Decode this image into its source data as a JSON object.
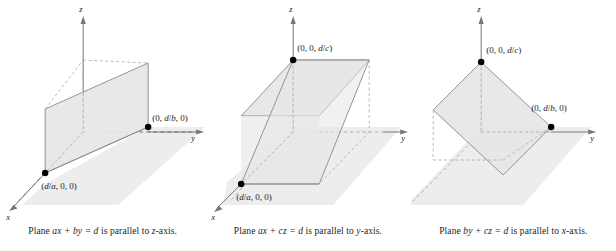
{
  "figure": {
    "background_color": "#ffffff",
    "plane_fill": "#ededed",
    "plane_fill_dark": "#e2e2e2",
    "stroke_color": "#8a8a8a",
    "axis_color": "#777777",
    "dash_color": "#a8a8a8",
    "vertex_color": "#000000",
    "text_color": "#1c1c1c"
  },
  "panels": [
    {
      "id": "panel-1",
      "caption": "Plane ax + by = d is parallel to z-axis.",
      "caption_parts": {
        "lead": "Plane ",
        "equation": "ax + by = d",
        "middle": " is parallel to ",
        "axis": "z",
        "tail": "-axis."
      },
      "axes": [
        {
          "name": "x",
          "label": "x"
        },
        {
          "name": "y",
          "label": "y"
        },
        {
          "name": "z",
          "label": "z"
        }
      ],
      "points": [
        {
          "name": "x-intercept",
          "label": "(d/a, 0, 0)",
          "coords": "d/a, 0, 0"
        },
        {
          "name": "y-intercept",
          "label": "(0, d/b, 0)",
          "coords": "0, d/b, 0"
        }
      ],
      "plane_equation": "ax + by = d",
      "parallel_to": "z-axis"
    },
    {
      "id": "panel-2",
      "caption": "Plane ax + cz = d is parallel to y-axis.",
      "caption_parts": {
        "lead": "Plane ",
        "equation": "ax + cz = d",
        "middle": " is parallel to ",
        "axis": "y",
        "tail": "-axis."
      },
      "axes": [
        {
          "name": "x",
          "label": "x"
        },
        {
          "name": "y",
          "label": "y"
        },
        {
          "name": "z",
          "label": "z"
        }
      ],
      "points": [
        {
          "name": "x-intercept",
          "label": "(d/a, 0, 0)",
          "coords": "d/a, 0, 0"
        },
        {
          "name": "z-intercept",
          "label": "(0, 0, d/c)",
          "coords": "0, 0, d/c"
        }
      ],
      "plane_equation": "ax + cz = d",
      "parallel_to": "y-axis"
    },
    {
      "id": "panel-3",
      "caption": "Plane by + cz = d is parallel to x-axis.",
      "caption_parts": {
        "lead": "Plane ",
        "equation": "by + cz = d",
        "middle": " is parallel to ",
        "axis": "x",
        "tail": "-axis."
      },
      "axes": [
        {
          "name": "y",
          "label": "y"
        },
        {
          "name": "z",
          "label": "z"
        }
      ],
      "points": [
        {
          "name": "z-intercept",
          "label": "(0, 0, d/c)",
          "coords": "0, 0, d/c"
        },
        {
          "name": "y-intercept",
          "label": "(0, d/b, 0)",
          "coords": "0, d/b, 0"
        }
      ],
      "plane_equation": "by + cz = d",
      "parallel_to": "x-axis"
    }
  ]
}
